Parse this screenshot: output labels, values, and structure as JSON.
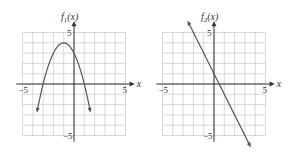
{
  "chart_data": [
    {
      "type": "line",
      "title": "f1(x)",
      "ylabel": "f1(x)",
      "xlabel": "x",
      "xlim": [
        -5,
        5
      ],
      "ylim": [
        -5,
        5
      ],
      "grid": true,
      "tick_labels": {
        "x": [
          "-5",
          "5"
        ],
        "y": [
          "5",
          "-5"
        ]
      },
      "function": "-(x+1)^2 + 4",
      "x": [
        -3.6,
        -3,
        -2,
        -1,
        0,
        1,
        1.6
      ],
      "y": [
        -2.76,
        0,
        3,
        4,
        3,
        0,
        -2.76
      ],
      "extends_beyond": "arrows at both ends pointing down",
      "vertex": [
        -1,
        4
      ],
      "x_intercepts": [
        -3,
        1
      ],
      "y_intercept": 3
    },
    {
      "type": "line",
      "title": "f2(x)",
      "ylabel": "f2(x)",
      "xlabel": "x",
      "xlim": [
        -5,
        5
      ],
      "ylim": [
        -5,
        5
      ],
      "grid": true,
      "tick_labels": {
        "x": [
          "-5",
          "5"
        ],
        "y": [
          "5",
          "-5"
        ]
      },
      "function": "-2x + 1",
      "x": [
        -2.5,
        0,
        0.5,
        3.5
      ],
      "y": [
        6,
        1,
        0,
        -6
      ],
      "extends_beyond": "arrows at both ends",
      "slope": -2,
      "y_intercept": 1,
      "x_intercept": 0.5
    }
  ],
  "labels": {
    "f1_title": "f",
    "f1_sub": "1",
    "f2_title": "f",
    "f2_sub": "2",
    "arg": "(x)",
    "x_axis": "x",
    "neg5": "−5",
    "pos5": "5"
  },
  "colors": {
    "grid": "#c8c8c8",
    "axis": "#333333",
    "curve": "#555555"
  }
}
